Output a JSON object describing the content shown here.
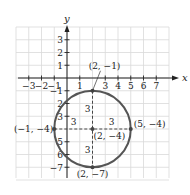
{
  "diagram": {
    "type": "coordinate-plane-circle",
    "axes": {
      "x_label": "x",
      "y_label": "y",
      "x_ticks": [
        "-3",
        "-2",
        "-1",
        "1",
        "3",
        "4",
        "5",
        "6",
        "7"
      ],
      "x_tick_values": [
        -3,
        -2,
        -1,
        1,
        3,
        4,
        5,
        6,
        7
      ],
      "y_ticks": [
        "3",
        "2",
        "1",
        "-1",
        "2",
        "3",
        "5",
        "6",
        "-7"
      ],
      "y_tick_values": [
        3,
        2,
        1,
        -1,
        -2,
        -3,
        -5,
        -6,
        -7
      ],
      "x_range": [
        -4,
        8
      ],
      "y_range": [
        -8,
        4
      ]
    },
    "circle": {
      "center": [
        2,
        -4
      ],
      "radius": 3,
      "color": "#555555"
    },
    "points": [
      {
        "label": "(2, −1)",
        "x": 2,
        "y": -1
      },
      {
        "label": "(−1, −4)",
        "x": -1,
        "y": -4
      },
      {
        "label": "(2, −4)",
        "x": 2,
        "y": -4
      },
      {
        "label": "(5, −4)",
        "x": 5,
        "y": -4
      },
      {
        "label": "(2, −7)",
        "x": 2,
        "y": -7
      }
    ],
    "radius_labels": [
      "3",
      "3",
      "3",
      "3"
    ],
    "grid_color": "#d9d9d9",
    "axis_color": "#222222"
  }
}
